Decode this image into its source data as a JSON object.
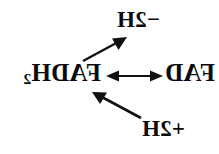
{
  "figure": {
    "background_color": "#ffffff",
    "ink_color": "#111111",
    "orientation": "horizontally-mirrored",
    "width": 219,
    "height": 154
  },
  "labels": {
    "dehydrogenation": {
      "text": "−2H",
      "plain": "-2H",
      "position": "top"
    },
    "reduced_form": {
      "text": "FADH",
      "subscript": "2",
      "plain": "FADH2",
      "position": "middle-left"
    },
    "oxidized_form": {
      "text": "FAD",
      "plain": "FAD",
      "position": "middle-right"
    },
    "hydrogenation": {
      "text": "+2H",
      "plain": "+2H",
      "position": "bottom"
    }
  },
  "arrows": {
    "equilibrium": {
      "glyph": "⟷",
      "kind": "double-headed",
      "from": "FADH2",
      "to": "FAD"
    },
    "oxidation": {
      "kind": "single-headed",
      "direction": "up-right",
      "from": "FADH2",
      "to": "−2H"
    },
    "reduction": {
      "kind": "single-headed",
      "direction": "up-left",
      "from": "+2H",
      "to": "FADH2"
    }
  }
}
